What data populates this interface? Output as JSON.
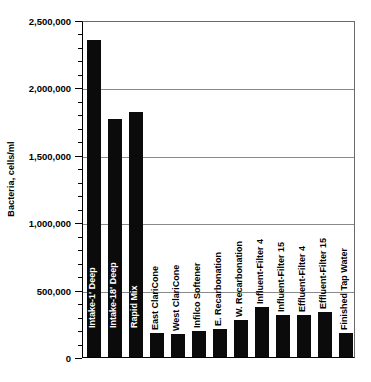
{
  "chart_data": {
    "type": "bar",
    "title": "",
    "xlabel": "",
    "ylabel": "Bacteria, cells/ml",
    "ylim": [
      0,
      2500000
    ],
    "grid": true,
    "legend": "none",
    "y_major_step": 500000,
    "y_minor_step": 100000,
    "y_tick_labels": [
      "2,500,000",
      "2,000,000",
      "1,500,000",
      "1,000,000",
      "500,000",
      "0"
    ],
    "y_tick_values": [
      2500000,
      2000000,
      1500000,
      1000000,
      500000,
      0
    ],
    "categories": [
      "Intake-1' Deep",
      "Intake-18' Deep",
      "Rapid Mix",
      "East ClariCone",
      "West ClariCone",
      "Infilco Softener",
      "E. Recarbonation",
      "W. Recarbonation",
      "Influent-Filter 4",
      "Influent-Filter 15",
      "Effluent-Filter 4",
      "Effluent-Filter 15",
      "Finished Tap Water"
    ],
    "values": [
      2350000,
      1765000,
      1815000,
      180000,
      170000,
      190000,
      210000,
      275000,
      370000,
      310000,
      315000,
      335000,
      175000
    ],
    "bar_color": "#0b0b0b",
    "label_color_inside": "#ffffff",
    "label_color_outside": "#000000"
  }
}
